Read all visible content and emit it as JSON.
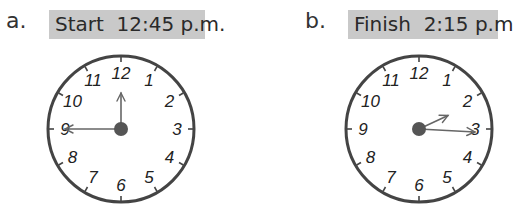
{
  "problems": [
    {
      "letter": "a.",
      "label": "Start  12:45 p.m.",
      "clock": {
        "hour_hand_angle": 0,
        "minute_hand_angle": 270,
        "time": "12:45"
      }
    },
    {
      "letter": "b.",
      "label": "Finish  2:15 p.m.",
      "clock": {
        "hour_hand_angle": 65,
        "minute_hand_angle": 93,
        "time": "2:15"
      }
    }
  ],
  "clock_numbers": [
    "12",
    "1",
    "2",
    "3",
    "4",
    "5",
    "6",
    "7",
    "8",
    "9",
    "10",
    "11"
  ],
  "colors": {
    "label_bg": "#c9c9c9",
    "rim": "#444444",
    "center_dot": "#555555",
    "hand": "#666666"
  }
}
